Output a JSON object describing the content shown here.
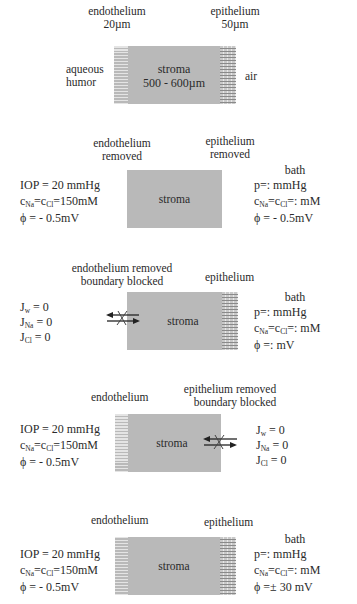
{
  "panels": [
    {
      "id": "anatomy",
      "endothelium_label": "endothelium",
      "endothelium_thickness": "20µm",
      "epithelium_label": "epithelium",
      "epithelium_thickness": "50µm",
      "left_region": [
        "aqueous",
        "humor"
      ],
      "right_region": "air",
      "stroma_label": "stroma",
      "stroma_thickness": "500 - 600µm"
    },
    {
      "id": "both-removed",
      "top_left_label": [
        "endothelium",
        "removed"
      ],
      "top_right_label": [
        "epithelium",
        "removed"
      ],
      "stroma_label": "stroma",
      "left_conditions": {
        "iop": "IOP = 20 mmHg",
        "conc_c1": "c",
        "conc_s1": "Na",
        "conc_eq": "=c",
        "conc_s2": "Cl",
        "conc_val": "=150mM",
        "phi": "ϕ = - 0.5mV"
      },
      "right_conditions": {
        "title": "bath",
        "p": "p=:    mmHg",
        "conc_c1": "c",
        "conc_s1": "Na",
        "conc_eq": "=c",
        "conc_s2": "Cl",
        "conc_val": "=:     mM",
        "phi": "ϕ = - 0.5mV"
      }
    },
    {
      "id": "endothelium-blocked",
      "top_left_label": [
        "endothelium removed",
        "boundary blocked"
      ],
      "top_right_label": "epithelium",
      "stroma_label": "stroma",
      "left_fluxes": [
        {
          "sym": "J",
          "sub": "w",
          "val": " = 0"
        },
        {
          "sym": "J",
          "sub": "Na",
          "val": " = 0"
        },
        {
          "sym": "J",
          "sub": "Cl",
          "val": " = 0"
        }
      ],
      "right_conditions": {
        "title": "bath",
        "p": "p=:    mmHg",
        "conc_c1": "c",
        "conc_s1": "Na",
        "conc_eq": "=c",
        "conc_s2": "Cl",
        "conc_val": "=:     mM",
        "phi": "ϕ =:   mV"
      }
    },
    {
      "id": "epithelium-blocked",
      "top_left_label": "endothelium",
      "top_right_label": [
        "epithelium removed",
        "boundary blocked"
      ],
      "stroma_label": "stroma",
      "left_conditions": {
        "iop": "IOP = 20 mmHg",
        "conc_c1": "c",
        "conc_s1": "Na",
        "conc_eq": "=c",
        "conc_s2": "Cl",
        "conc_val": "=150mM",
        "phi": "ϕ = - 0.5mV"
      },
      "right_fluxes": [
        {
          "sym": "J",
          "sub": "w",
          "val": " = 0"
        },
        {
          "sym": "J",
          "sub": "Na",
          "val": " = 0"
        },
        {
          "sym": "J",
          "sub": "Cl",
          "val": " = 0"
        }
      ]
    },
    {
      "id": "intact",
      "top_left_label": "endothelium",
      "top_right_label": "epithelium",
      "stroma_label": "stroma",
      "left_conditions": {
        "iop": "IOP = 20 mmHg",
        "conc_c1": "c",
        "conc_s1": "Na",
        "conc_eq": "=c",
        "conc_s2": "Cl",
        "conc_val": "=150mM",
        "phi": "ϕ = - 0.5mV"
      },
      "right_conditions": {
        "title": "bath",
        "p": "p=:    mmHg",
        "conc_c1": "c",
        "conc_s1": "Na",
        "conc_eq": "=c",
        "conc_s2": "Cl",
        "conc_val": "=:     mM",
        "phi": "ϕ =± 30 mV"
      }
    }
  ]
}
